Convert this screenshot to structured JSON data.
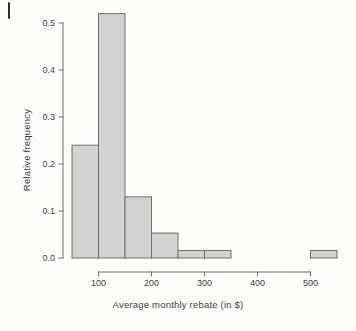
{
  "figure": {
    "scan_artifact": "vertical-scan-mark"
  },
  "chart_data": {
    "type": "bar",
    "title": "",
    "subtitle": "",
    "xlabel": "Average monthly rebate (in $)",
    "ylabel": "Relative frequency",
    "bin_width": 50,
    "bin_edges": [
      50,
      100,
      150,
      200,
      250,
      300,
      350,
      400,
      450,
      500,
      550
    ],
    "categories": [
      "50-100",
      "100-150",
      "150-200",
      "200-250",
      "250-300",
      "300-350",
      "350-400",
      "400-450",
      "450-500",
      "500-550"
    ],
    "values": [
      0.24,
      0.52,
      0.13,
      0.053,
      0.016,
      0.016,
      0.0,
      0.0,
      0.0,
      0.016
    ],
    "x": [
      75,
      125,
      175,
      225,
      275,
      325,
      375,
      425,
      475,
      525
    ],
    "xlim": [
      50,
      550
    ],
    "ylim": [
      0.0,
      0.52
    ],
    "xticks": [
      100,
      200,
      300,
      400,
      500
    ],
    "xtick_labels": [
      "100",
      "200",
      "300",
      "400",
      "500"
    ],
    "yticks": [
      0.0,
      0.1,
      0.2,
      0.3,
      0.4,
      0.5
    ],
    "ytick_labels": [
      "0.0",
      "0.1",
      "0.2",
      "0.3",
      "0.4",
      "0.5"
    ],
    "grid": false,
    "legend": null,
    "legend_position": "none",
    "bar_fill_color": "#d2d2d2",
    "bar_edge_color": "#6e6e6e",
    "axis_color": "#6e6e6e",
    "text_color": "#3d3d3d",
    "background_color": "#fdfdfb"
  }
}
